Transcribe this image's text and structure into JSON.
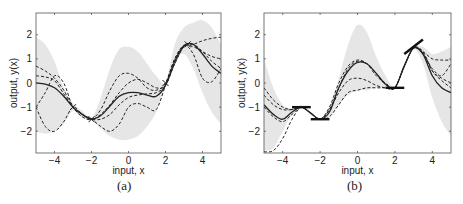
{
  "chart_data": [
    {
      "type": "line",
      "panel": "(a)",
      "xlabel": "input, x",
      "ylabel": "output, y(x)",
      "xlim": [
        -5,
        5
      ],
      "ylim": [
        -2.9,
        2.9
      ],
      "xticks": [
        -4,
        -2,
        0,
        2,
        4
      ],
      "yticks": [
        -2,
        -1,
        0,
        1,
        2
      ],
      "grid": false,
      "legend": null,
      "observations": [
        {
          "x": -3.0,
          "y": -1.0
        },
        {
          "x": -2.0,
          "y": -1.5
        },
        {
          "x": 2.0,
          "y": 0.0
        },
        {
          "x": 3.2,
          "y": 1.6
        }
      ],
      "band": {
        "name": "95% confidence region",
        "x": [
          -5,
          -4.5,
          -4,
          -3.5,
          -3,
          -2.5,
          -2,
          -1.5,
          -1,
          -0.5,
          0,
          0.5,
          1,
          1.5,
          2,
          2.5,
          3,
          3.5,
          4,
          4.5,
          5
        ],
        "upper": [
          1.9,
          1.6,
          0.9,
          -0.2,
          -0.85,
          -1.15,
          -1.45,
          -0.6,
          0.6,
          1.4,
          1.5,
          1.3,
          0.8,
          0.3,
          0.05,
          1.6,
          2.3,
          2.5,
          2.6,
          2.3,
          1.6
        ],
        "lower": [
          -2.0,
          -2.1,
          -2.0,
          -1.7,
          -1.15,
          -1.45,
          -1.55,
          -1.9,
          -2.2,
          -2.35,
          -2.35,
          -2.2,
          -1.8,
          -1.2,
          -0.1,
          0.9,
          1.2,
          0.6,
          -0.4,
          -1.2,
          -1.7
        ]
      },
      "series": [
        {
          "name": "mean",
          "style": "solid",
          "x": [
            -5,
            -4.5,
            -4,
            -3.5,
            -3,
            -2.5,
            -2,
            -1.5,
            -1,
            -0.5,
            0,
            0.5,
            1,
            1.5,
            2,
            2.5,
            3,
            3.5,
            4,
            4.5,
            5
          ],
          "y": [
            0.0,
            -0.05,
            -0.2,
            -0.55,
            -1.0,
            -1.3,
            -1.5,
            -1.35,
            -0.95,
            -0.55,
            -0.4,
            -0.4,
            -0.5,
            -0.55,
            -0.1,
            0.9,
            1.55,
            1.6,
            1.2,
            0.7,
            0.4
          ]
        },
        {
          "name": "sample 1",
          "style": "dashed",
          "x": [
            -5,
            -4.5,
            -4,
            -3.5,
            -3,
            -2.5,
            -2,
            -1.5,
            -1,
            -0.5,
            0,
            0.5,
            1,
            1.5,
            2,
            2.5,
            3,
            3.5,
            4,
            4.5,
            5
          ],
          "y": [
            0.7,
            0.5,
            0.2,
            -0.3,
            -1.0,
            -1.4,
            -1.5,
            -1.1,
            -0.3,
            0.3,
            0.4,
            0.2,
            -0.2,
            -0.3,
            0.0,
            1.0,
            1.5,
            1.6,
            1.75,
            1.85,
            1.9
          ]
        },
        {
          "name": "sample 2",
          "style": "dashed",
          "x": [
            -5,
            -4.5,
            -4,
            -3.5,
            -3,
            -2.5,
            -2,
            -1.5,
            -1,
            -0.5,
            0,
            0.5,
            1,
            1.5,
            2,
            2.5,
            3,
            3.5,
            4,
            4.5,
            5
          ],
          "y": [
            -1.0,
            -0.4,
            0.3,
            0.0,
            -1.0,
            -1.3,
            -1.5,
            -1.3,
            -0.9,
            -0.4,
            0.0,
            0.15,
            0.0,
            -0.2,
            -0.1,
            0.8,
            1.5,
            1.5,
            1.3,
            1.1,
            1.0
          ]
        },
        {
          "name": "sample 3",
          "style": "dashed",
          "x": [
            -5,
            -4.5,
            -4,
            -3.5,
            -3,
            -2.5,
            -2,
            -1.5,
            -1,
            -0.5,
            0,
            0.5,
            1,
            1.5,
            2,
            2.5,
            3,
            3.5,
            4,
            4.5,
            5
          ],
          "y": [
            -1.0,
            -1.8,
            -2.0,
            -1.6,
            -1.0,
            -1.3,
            -1.5,
            -1.8,
            -2.0,
            -1.7,
            -1.0,
            -0.85,
            -1.0,
            -1.1,
            -0.1,
            1.0,
            1.55,
            1.2,
            0.2,
            0.05,
            0.6
          ]
        },
        {
          "name": "sample 4",
          "style": "dashed",
          "x": [
            -5,
            -4.5,
            -4,
            -3.5,
            -3,
            -2.5,
            -2,
            -1.5,
            -1,
            -0.5,
            0,
            0.5,
            1,
            1.5,
            2,
            2.5,
            3,
            3.5,
            4,
            4.5,
            5
          ],
          "y": [
            0.3,
            0.25,
            0.1,
            -0.45,
            -1.0,
            -1.3,
            -1.5,
            -1.5,
            -1.3,
            -0.9,
            -0.6,
            -0.5,
            -0.45,
            -0.4,
            -0.1,
            0.8,
            1.5,
            1.6,
            1.3,
            0.9,
            0.6
          ]
        }
      ]
    },
    {
      "type": "line",
      "panel": "(b)",
      "xlabel": "input, x",
      "ylabel": "output, y(x)",
      "xlim": [
        -5,
        5
      ],
      "ylim": [
        -2.9,
        2.9
      ],
      "xticks": [
        -4,
        -2,
        0,
        2,
        4
      ],
      "yticks": [
        -2,
        -1,
        0,
        1,
        2
      ],
      "grid": false,
      "legend": null,
      "derivative_observations": [
        {
          "x": -3.0,
          "y": -1.0,
          "slope": 0
        },
        {
          "x": -2.0,
          "y": -1.5,
          "slope": 0
        },
        {
          "x": 2.0,
          "y": -0.2,
          "slope": 0
        },
        {
          "x": 3.0,
          "y": 1.5,
          "slope": 0.6
        }
      ],
      "band": {
        "name": "95% confidence region",
        "x": [
          -5,
          -4.5,
          -4,
          -3.5,
          -3,
          -2.5,
          -2,
          -1.5,
          -1,
          -0.5,
          0,
          0.5,
          1,
          1.5,
          2,
          2.5,
          3,
          3.5,
          4,
          4.5,
          5
        ],
        "upper": [
          1.0,
          -0.2,
          -0.9,
          -1.05,
          -0.95,
          -1.2,
          -1.45,
          -1.0,
          0.2,
          1.6,
          2.4,
          2.1,
          1.1,
          0.3,
          -0.15,
          0.8,
          1.45,
          1.5,
          1.2,
          1.3,
          1.5
        ],
        "lower": [
          -2.8,
          -2.7,
          -2.0,
          -1.3,
          -1.05,
          -1.3,
          -1.55,
          -1.4,
          -0.9,
          -0.5,
          -0.3,
          -0.3,
          -0.2,
          -0.2,
          -0.25,
          0.6,
          1.4,
          0.8,
          -0.6,
          -1.6,
          -2.2
        ]
      },
      "series": [
        {
          "name": "mean",
          "style": "solid",
          "x": [
            -5,
            -4.5,
            -4,
            -3.5,
            -3,
            -2.5,
            -2,
            -1.5,
            -1,
            -0.5,
            0,
            0.5,
            1,
            1.5,
            2,
            2.5,
            3,
            3.5,
            4,
            4.5,
            5
          ],
          "y": [
            -0.9,
            -1.3,
            -1.5,
            -1.2,
            -1.0,
            -1.25,
            -1.5,
            -1.2,
            -0.2,
            0.5,
            0.85,
            0.8,
            0.4,
            -0.05,
            -0.2,
            0.7,
            1.45,
            1.2,
            0.3,
            -0.2,
            -0.4
          ]
        },
        {
          "name": "sample 1",
          "style": "dashed",
          "x": [
            -5,
            -4.5,
            -4,
            -3.5,
            -3,
            -2.5,
            -2,
            -1.5,
            -1,
            -0.5,
            0,
            0.5,
            1,
            1.5,
            2,
            2.5,
            3,
            3.5,
            4,
            4.5,
            5
          ],
          "y": [
            -0.2,
            -0.7,
            -1.0,
            -1.1,
            -1.0,
            -1.25,
            -1.5,
            -1.0,
            0.0,
            0.7,
            0.95,
            0.8,
            0.3,
            0.0,
            -0.2,
            0.7,
            1.45,
            1.3,
            1.0,
            0.95,
            0.95
          ]
        },
        {
          "name": "sample 2",
          "style": "dashed",
          "x": [
            -5,
            -4.5,
            -4,
            -3.5,
            -3,
            -2.5,
            -2,
            -1.5,
            -1,
            -0.5,
            0,
            0.5,
            1,
            1.5,
            2,
            2.5,
            3,
            3.5,
            4,
            4.5,
            5
          ],
          "y": [
            -0.5,
            -0.9,
            -1.1,
            -1.1,
            -1.0,
            -1.25,
            -1.5,
            -1.1,
            -0.4,
            0.1,
            0.2,
            0.1,
            -0.1,
            -0.2,
            -0.2,
            0.7,
            1.45,
            1.3,
            0.5,
            0.2,
            0.0
          ]
        },
        {
          "name": "sample 3",
          "style": "dashed",
          "x": [
            -5,
            -4.5,
            -4,
            -3.5,
            -3,
            -2.5,
            -2,
            -1.5,
            -1,
            -0.5,
            0,
            0.5,
            1,
            1.5,
            2,
            2.5,
            3,
            3.5,
            4,
            4.5,
            5
          ],
          "y": [
            -2.85,
            -2.8,
            -2.3,
            -1.5,
            -1.0,
            -1.25,
            -1.5,
            -1.4,
            -0.9,
            -0.4,
            -0.3,
            -0.2,
            -0.2,
            -0.2,
            -0.2,
            0.7,
            1.45,
            1.2,
            0.6,
            0.3,
            0.8
          ]
        },
        {
          "name": "sample 4",
          "style": "dashed",
          "x": [
            -5,
            -4.5,
            -4,
            -3.5,
            -3,
            -2.5,
            -2,
            -1.5,
            -1,
            -0.5,
            0,
            0.5,
            1,
            1.5,
            2,
            2.5,
            3,
            3.5,
            4,
            4.5,
            5
          ],
          "y": [
            -1.0,
            -1.4,
            -1.6,
            -1.3,
            -1.0,
            -1.25,
            -1.5,
            -1.1,
            -0.2,
            0.6,
            0.9,
            0.8,
            0.4,
            -0.05,
            -0.2,
            0.7,
            1.45,
            1.25,
            0.5,
            0.1,
            -0.2
          ]
        }
      ]
    }
  ],
  "figure": {
    "panels": [
      {
        "label": "(a)",
        "xlabel": "input, x",
        "ylabel": "output, y(x)"
      },
      {
        "label": "(b)",
        "xlabel": "input, x",
        "ylabel": "output, y(x)"
      }
    ]
  },
  "colors": {
    "band": "#e6e6e6",
    "line": "#222222",
    "axis": "#555555"
  }
}
